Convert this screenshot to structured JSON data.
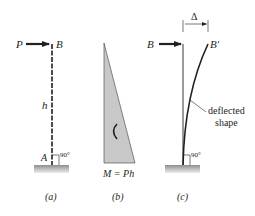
{
  "figure": {
    "panel_a": {
      "load_label": "P",
      "top_label": "B",
      "height_label": "h",
      "base_label": "A",
      "angle_label": "90°",
      "caption": "(a)"
    },
    "panel_b": {
      "moment_label": "M = Ph",
      "caption": "(b)"
    },
    "panel_c": {
      "top_label": "B",
      "deflected_top_label": "B′",
      "deflection_label": "Δ",
      "curve_label_line1": "deflected",
      "curve_label_line2": "shape",
      "angle_label": "90°",
      "caption": "(c)"
    },
    "colors": {
      "ink": "#231f20",
      "moment_fill": "#c8c8c8",
      "ground_top": "#9a9a9a",
      "ground_bottom": "#e6e6e6"
    }
  }
}
